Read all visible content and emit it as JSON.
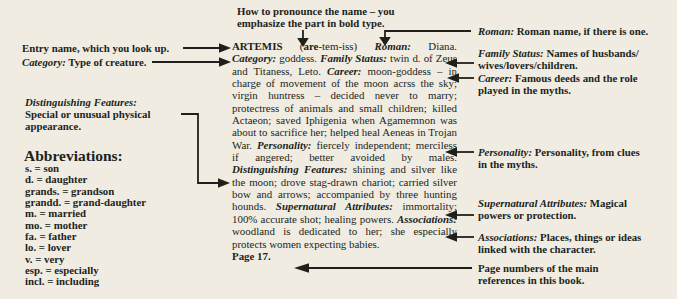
{
  "page": {
    "background": "#f0ece1",
    "ink": "#211f1c"
  },
  "pronounce_note": {
    "line1": "How to pronounce the name – you",
    "line2": "emphasize the part in bold type."
  },
  "left_notes": {
    "entry_name": "Entry name, which you look up.",
    "category_label": "Category:",
    "category_text": " Type of creature.",
    "distinguishing_label": "Distinguishing Features:",
    "distinguishing_line2": "Special or unusual physical",
    "distinguishing_line3": "appearance."
  },
  "abbreviations": {
    "heading": "Abbreviations:",
    "items": [
      "s. = son",
      "d. = daughter",
      "grands. = grandson",
      "grandd. = grand-daughter",
      "m. = married",
      "mo. = mother",
      "fa. = father",
      "lo. = lover",
      "v. = very",
      "esp. = especially",
      "incl. = including"
    ]
  },
  "entry": {
    "name": "ARTEMIS ",
    "paren_open": "(",
    "pron_stress": "are",
    "pron_rest": "-tem-iss) ",
    "roman_label": "Roman:",
    "roman_text": " Diana. ",
    "category_label": "Category:",
    "category_text": " goddess. ",
    "family_label": "Family Status:",
    "family_text": " twin d. of Zeus and Titaness, Leto. ",
    "career_label": "Career:",
    "career_text": " moon-goddess – in charge of movement of the moon acrss the sky; virgin huntress – decided never to marry; protectress of animals and small children; killed Actaeon; saved Iphigenia when Agamemnon was about to sacrifice her; helped heal Aeneas in Trojan War. ",
    "personality_label": "Personality:",
    "personality_text": " fiercely independent; merciless if angered; better avoided by males. ",
    "distinguishing_label": "Distinguishing Features:",
    "distinguishing_text": " shining and silver like the moon; drove stag-drawn chariot; carried silver bow and arrows; accompanied by three hunting hounds. ",
    "supernatural_label": "Supernatural Attributes:",
    "supernatural_text": " immortality; 100% accurate shot; healing powers. ",
    "associations_label": "Associations:",
    "associations_text": " woodland is dedicated to her; she especially protects women expecting babies.",
    "page_ref": "Page 17."
  },
  "right_notes": {
    "roman_label": "Roman:",
    "roman_text": " Roman name, if there is one.",
    "family_label": "Family Status:",
    "family_text": " Names of husbands/",
    "family_line2": "wives/lovers/children.",
    "career_label": "Career:",
    "career_text": " Famous deeds and the role",
    "career_line2": "played in the myths.",
    "personality_label": "Personality:",
    "personality_text": " Personality, from clues",
    "personality_line2": "in the myths.",
    "supernatural_label": "Supernatural Attributes:",
    "supernatural_text": " Magical",
    "supernatural_line2": "powers or protection.",
    "associations_label": "Associations:",
    "associations_text": " Places, things or ideas",
    "associations_line2": "linked with the character.",
    "page_numbers_line1": "Page numbers of the main",
    "page_numbers_line2": "references in this book."
  }
}
